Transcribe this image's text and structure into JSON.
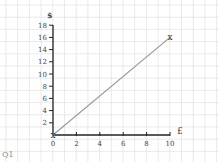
{
  "chart_data": {
    "type": "line",
    "title": "",
    "xlabel": "£",
    "ylabel": "$",
    "x": [
      0,
      10
    ],
    "series": [
      {
        "name": "conversion",
        "values": [
          0,
          16
        ],
        "color": "#9a9a9a"
      }
    ],
    "xticks": [
      "0",
      "2",
      "4",
      "6",
      "8",
      "10"
    ],
    "yticks": [
      "2",
      "4",
      "6",
      "8",
      "10",
      "12",
      "14",
      "16",
      "18"
    ],
    "xlim": [
      0,
      10
    ],
    "ylim": [
      0,
      18
    ],
    "grid": true,
    "markers": [
      {
        "x": 0,
        "y": 0,
        "symbol": "x"
      },
      {
        "x": 10,
        "y": 16,
        "symbol": "x"
      }
    ]
  },
  "caption": "Q1"
}
